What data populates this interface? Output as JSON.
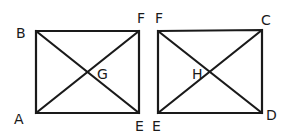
{
  "diagram": {
    "left_rectangle": {
      "vertices": {
        "B": [
          36,
          31
        ],
        "F": [
          139,
          31
        ],
        "E": [
          139,
          113
        ],
        "A": [
          36,
          113
        ]
      },
      "center_label": "G",
      "labels": [
        {
          "text": "B",
          "x": 16,
          "y": 38
        },
        {
          "text": "F",
          "x": 137,
          "y": 23
        },
        {
          "text": "A",
          "x": 14,
          "y": 124
        },
        {
          "text": "E",
          "x": 135,
          "y": 131
        },
        {
          "text": "G",
          "x": 97,
          "y": 79
        }
      ]
    },
    "right_rectangle": {
      "vertices": {
        "F": [
          158,
          31
        ],
        "C": [
          262,
          30
        ],
        "D": [
          262,
          113
        ],
        "E": [
          158,
          113
        ]
      },
      "center_label": "H",
      "labels": [
        {
          "text": "F",
          "x": 155,
          "y": 23
        },
        {
          "text": "C",
          "x": 261,
          "y": 25
        },
        {
          "text": "D",
          "x": 266,
          "y": 120
        },
        {
          "text": "E",
          "x": 152,
          "y": 131
        },
        {
          "text": "H",
          "x": 192,
          "y": 79
        }
      ]
    }
  }
}
